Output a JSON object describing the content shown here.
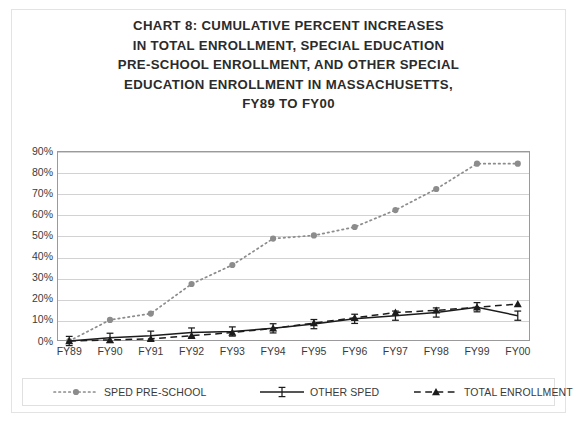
{
  "title": {
    "lines": [
      "CHART 8:  CUMULATIVE PERCENT INCREASES",
      "IN TOTAL ENROLLMENT, SPECIAL EDUCATION",
      "PRE-SCHOOL ENROLLMENT, AND OTHER SPECIAL",
      "EDUCATION ENROLLMENT IN MASSACHUSETTS,",
      "FY89 TO FY00"
    ],
    "full": "CHART 8:  CUMULATIVE PERCENT INCREASES IN TOTAL ENROLLMENT, SPECIAL EDUCATION PRE-SCHOOL ENROLLMENT, AND OTHER SPECIAL EDUCATION ENROLLMENT IN MASSACHUSETTS, FY89 TO FY00"
  },
  "colors": {
    "axis": "#9a9a9a",
    "grid": "#d2d2d2",
    "series_sped_preschool": "#8c8c8c",
    "series_other_sped": "#1c1c1c",
    "series_total_enrollment": "#1c1c1c",
    "text": "#3a3a3a",
    "frame": "#e3e3e3",
    "background": "#ffffff"
  },
  "legend": {
    "position": "bottom",
    "items": [
      {
        "label": "SPED PRE-SCHOOL",
        "marker": "circle",
        "line": "dotted",
        "key": "sped-pre-school"
      },
      {
        "label": "OTHER SPED",
        "marker": "ibar",
        "line": "solid",
        "key": "other-sped"
      },
      {
        "label": "TOTAL ENROLLMENT",
        "marker": "triangle",
        "line": "dashed",
        "key": "total-enrollment"
      }
    ]
  },
  "chart_data": {
    "type": "line",
    "title": "CHART 8:  CUMULATIVE PERCENT INCREASES IN TOTAL ENROLLMENT, SPECIAL EDUCATION PRE-SCHOOL ENROLLMENT, AND OTHER SPECIAL EDUCATION ENROLLMENT IN MASSACHUSETTS, FY89 TO FY00",
    "xlabel": "",
    "ylabel": "",
    "categories": [
      "FY89",
      "FY90",
      "FY91",
      "FY92",
      "FY93",
      "FY94",
      "FY95",
      "FY96",
      "FY97",
      "FY98",
      "FY99",
      "FY00"
    ],
    "ytick_labels": [
      "0%",
      "10%",
      "20%",
      "30%",
      "40%",
      "50%",
      "60%",
      "70%",
      "80%",
      "90%"
    ],
    "ytick_values": [
      0,
      10,
      20,
      30,
      40,
      50,
      60,
      70,
      80,
      90
    ],
    "ylim": [
      0,
      90
    ],
    "grid": true,
    "legend_position": "bottom",
    "series": [
      {
        "name": "SPED PRE-SCHOOL",
        "marker": "circle",
        "line": "dotted",
        "color": "#8c8c8c",
        "values": [
          0,
          10,
          13,
          27,
          36,
          48.5,
          50,
          54,
          62,
          72,
          84,
          84
        ]
      },
      {
        "name": "OTHER SPED",
        "marker": "ibar",
        "line": "solid",
        "color": "#1c1c1c",
        "values": [
          0,
          1.5,
          2.5,
          4,
          4.5,
          6,
          8,
          10.5,
          12,
          13.5,
          16,
          12
        ]
      },
      {
        "name": "TOTAL ENROLLMENT",
        "marker": "triangle",
        "line": "dashed",
        "color": "#1c1c1c",
        "values": [
          0,
          0.5,
          1,
          2.5,
          4,
          6,
          8.5,
          11,
          13.5,
          14.5,
          16,
          17.5
        ]
      }
    ]
  }
}
